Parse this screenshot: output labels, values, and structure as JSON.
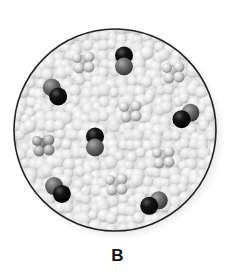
{
  "figure": {
    "label": "B",
    "circle": {
      "cx": 115,
      "cy": 130,
      "r": 101,
      "border_color": "#222222"
    },
    "colors": {
      "background_sphere": "#e6e6e6",
      "black_atom": "#111111",
      "gray_atom": "#6a6a6a",
      "light_atom": "#d4d4d4"
    }
  },
  "molecules": [
    {
      "type": "tetrahedral-light",
      "x": 83,
      "y": 62,
      "tone": "light"
    },
    {
      "type": "diatomic",
      "x": 124,
      "y": 61,
      "angle": 90,
      "first": "black",
      "second": "gray"
    },
    {
      "type": "tetrahedral-light",
      "x": 173,
      "y": 72,
      "tone": "medium"
    },
    {
      "type": "diatomic",
      "x": 55,
      "y": 92,
      "angle": 55,
      "first": "gray",
      "second": "black"
    },
    {
      "type": "tetrahedral-light",
      "x": 130,
      "y": 111,
      "tone": "light"
    },
    {
      "type": "diatomic",
      "x": 186,
      "y": 116,
      "angle": -35,
      "first": "black",
      "second": "gray"
    },
    {
      "type": "tetrahedral-dark",
      "x": 43,
      "y": 145,
      "tone": "dark"
    },
    {
      "type": "diatomic",
      "x": 95,
      "y": 142,
      "angle": 90,
      "first": "black",
      "second": "gray"
    },
    {
      "type": "tetrahedral-light",
      "x": 163,
      "y": 157,
      "tone": "light"
    },
    {
      "type": "diatomic",
      "x": 58,
      "y": 190,
      "angle": 45,
      "first": "gray",
      "second": "black"
    },
    {
      "type": "tetrahedral-light",
      "x": 116,
      "y": 184,
      "tone": "light"
    },
    {
      "type": "diatomic",
      "x": 154,
      "y": 203,
      "angle": -30,
      "first": "black",
      "second": "gray"
    }
  ]
}
